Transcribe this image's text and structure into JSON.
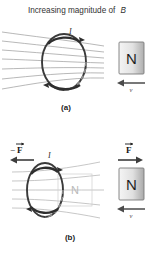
{
  "figure": {
    "title": "Increasing magnitude of",
    "title_symbol": "B",
    "panels": [
      {
        "id": "a",
        "caption": "(a)",
        "current_label": "I",
        "magnet_pole": "N",
        "velocity_label": "v",
        "velocity_direction": "left",
        "field_line_count": 7,
        "loop_shape": "ellipse",
        "current_direction": "counterclockwise-induced",
        "ghost_magnet": null,
        "force_labels": []
      },
      {
        "id": "b",
        "caption": "(b)",
        "current_label": "I",
        "magnet_pole": "N",
        "velocity_label": "v",
        "velocity_direction": "left",
        "field_line_count": 5,
        "loop_shape": "ellipse",
        "current_direction": "counterclockwise-induced",
        "ghost_magnet": {
          "pole": "N",
          "style": "phantom-outline"
        },
        "force_labels": [
          {
            "text": "F",
            "prefix": "−",
            "position": "left",
            "arrow_direction": "left"
          },
          {
            "text": "F",
            "prefix": "",
            "position": "right",
            "arrow_direction": "right"
          }
        ]
      }
    ]
  },
  "colors": {
    "background": "#ffffff",
    "field_line": "#9a9a9a",
    "loop_stroke": "#3a3a3a",
    "magnet_fill_light": "#f0f0f0",
    "magnet_fill_dark": "#b6b6b6",
    "magnet_border": "#6f6f6f",
    "ghost_stroke": "#cfcfcf",
    "text": "#2b2b2b"
  }
}
